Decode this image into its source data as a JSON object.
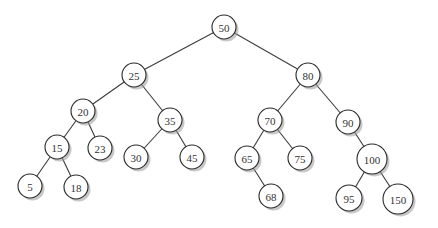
{
  "diagram": {
    "type": "binary-search-tree",
    "nodes": [
      {
        "id": "n50",
        "label": "50",
        "x": 224,
        "y": 27,
        "r": 12
      },
      {
        "id": "n25",
        "label": "25",
        "x": 134,
        "y": 75,
        "r": 12
      },
      {
        "id": "n80",
        "label": "80",
        "x": 308,
        "y": 75,
        "r": 12
      },
      {
        "id": "n20",
        "label": "20",
        "x": 83,
        "y": 111,
        "r": 12
      },
      {
        "id": "n35",
        "label": "35",
        "x": 170,
        "y": 120,
        "r": 12
      },
      {
        "id": "n70",
        "label": "70",
        "x": 270,
        "y": 120,
        "r": 12
      },
      {
        "id": "n90",
        "label": "90",
        "x": 348,
        "y": 122,
        "r": 12
      },
      {
        "id": "n15",
        "label": "15",
        "x": 57,
        "y": 147,
        "r": 12
      },
      {
        "id": "n23",
        "label": "23",
        "x": 100,
        "y": 148,
        "r": 12
      },
      {
        "id": "n30",
        "label": "30",
        "x": 136,
        "y": 157,
        "r": 12
      },
      {
        "id": "n45",
        "label": "45",
        "x": 192,
        "y": 157,
        "r": 12
      },
      {
        "id": "n65",
        "label": "65",
        "x": 247,
        "y": 158,
        "r": 12
      },
      {
        "id": "n75",
        "label": "75",
        "x": 300,
        "y": 158,
        "r": 12
      },
      {
        "id": "n100",
        "label": "100",
        "x": 372,
        "y": 159,
        "r": 15
      },
      {
        "id": "n5",
        "label": "5",
        "x": 30,
        "y": 186,
        "r": 12
      },
      {
        "id": "n18",
        "label": "18",
        "x": 76,
        "y": 187,
        "r": 12
      },
      {
        "id": "n68",
        "label": "68",
        "x": 271,
        "y": 196,
        "r": 12
      },
      {
        "id": "n95",
        "label": "95",
        "x": 349,
        "y": 198,
        "r": 13
      },
      {
        "id": "n150",
        "label": "150",
        "x": 398,
        "y": 199,
        "r": 15
      }
    ],
    "edges": [
      [
        "n50",
        "n25"
      ],
      [
        "n50",
        "n80"
      ],
      [
        "n25",
        "n20"
      ],
      [
        "n25",
        "n35"
      ],
      [
        "n80",
        "n70"
      ],
      [
        "n80",
        "n90"
      ],
      [
        "n20",
        "n15"
      ],
      [
        "n20",
        "n23"
      ],
      [
        "n35",
        "n30"
      ],
      [
        "n35",
        "n45"
      ],
      [
        "n70",
        "n65"
      ],
      [
        "n70",
        "n75"
      ],
      [
        "n90",
        "n100"
      ],
      [
        "n15",
        "n5"
      ],
      [
        "n15",
        "n18"
      ],
      [
        "n65",
        "n68"
      ],
      [
        "n100",
        "n95"
      ],
      [
        "n100",
        "n150"
      ]
    ]
  }
}
